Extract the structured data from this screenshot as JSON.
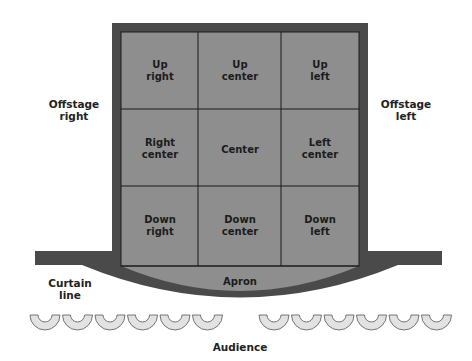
{
  "diagram": {
    "colors": {
      "frame": "#4a4a4a",
      "stage": "#8e8e8e",
      "grid_line": "#1a1a1a",
      "seat": "#e2e2e2",
      "seat_stroke": "#555555"
    },
    "grid": [
      [
        {
          "l1": "Up",
          "l2": "right"
        },
        {
          "l1": "Up",
          "l2": "center"
        },
        {
          "l1": "Up",
          "l2": "left"
        }
      ],
      [
        {
          "l1": "Right",
          "l2": "center"
        },
        {
          "l1": "Center",
          "l2": ""
        },
        {
          "l1": "Left",
          "l2": "center"
        }
      ],
      [
        {
          "l1": "Down",
          "l2": "right"
        },
        {
          "l1": "Down",
          "l2": "center"
        },
        {
          "l1": "Down",
          "l2": "left"
        }
      ]
    ],
    "apron": "Apron",
    "offstage_right": {
      "l1": "Offstage",
      "l2": "right"
    },
    "offstage_left": {
      "l1": "Offstage",
      "l2": "left"
    },
    "curtain_line": {
      "l1": "Curtain",
      "l2": "line"
    },
    "audience": "Audience",
    "seats_per_side": 6
  }
}
